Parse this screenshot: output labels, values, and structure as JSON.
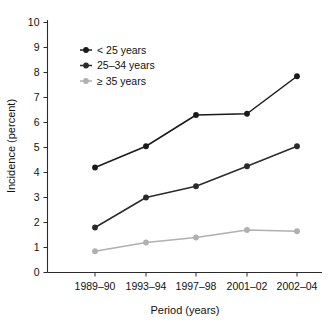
{
  "chart_data": {
    "type": "line",
    "title": "",
    "subtitle": "",
    "xlabel": "Period (years)",
    "ylabel": "Incidence (percent)",
    "categories": [
      "1989–90",
      "1993–94",
      "1997–98",
      "2001–02",
      "2002–04"
    ],
    "ylim": [
      0,
      10
    ],
    "ytick_labels": [
      "0",
      "1",
      "2",
      "3",
      "4",
      "5",
      "6",
      "7",
      "8",
      "9",
      "10"
    ],
    "ytick_values": [
      0,
      1,
      2,
      3,
      4,
      5,
      6,
      7,
      8,
      9,
      10
    ],
    "grid": false,
    "legend_position": "upper-left-inside",
    "series": [
      {
        "name": "< 25 years",
        "color": "#1a1a1a",
        "marker": "circle",
        "values": [
          4.2,
          5.05,
          6.3,
          6.35,
          7.85
        ]
      },
      {
        "name": "25–34 years",
        "color": "#2b2b2b",
        "marker": "circle",
        "values": [
          1.8,
          3.0,
          3.45,
          4.25,
          5.05
        ]
      },
      {
        "name": "≥ 35 years",
        "color": "#b0b0b0",
        "marker": "circle",
        "values": [
          0.85,
          1.2,
          1.4,
          1.7,
          1.65
        ]
      }
    ]
  },
  "figure": {
    "background": "#ffffff",
    "axis_color": "#2b2b2b"
  }
}
